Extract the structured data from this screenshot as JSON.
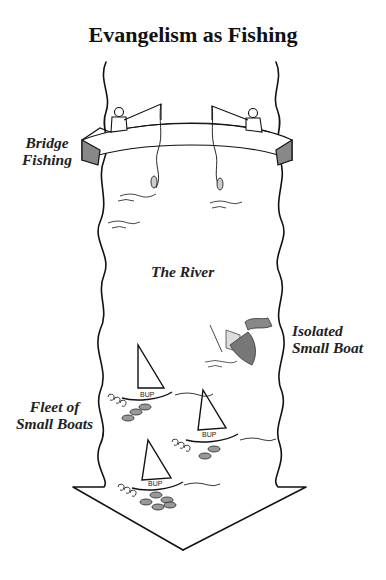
{
  "title": "Evangelism as Fishing",
  "labels": {
    "bridge": [
      "Bridge",
      "Fishing"
    ],
    "river": "The River",
    "isolated": [
      "Isolated",
      "Small Boat"
    ],
    "fleet": [
      "Fleet of",
      "Small Boats"
    ]
  },
  "figures": {
    "fishermen_on_bridge": 2,
    "fleet_boats": 3,
    "isolated_boat_state": "sinking",
    "boat_hull_text": "BUP"
  },
  "caption_truncated": "…"
}
